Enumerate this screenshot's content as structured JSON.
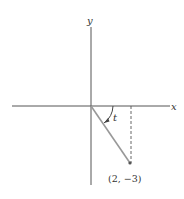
{
  "diagram": {
    "axes": {
      "x_label": "x",
      "y_label": "y"
    },
    "angle_label": "t",
    "point": {
      "x": 2,
      "y": -3,
      "label": "(2, −3)"
    },
    "colors": {
      "axis": "#555555",
      "segment": "#999999",
      "dashed": "#555555",
      "text": "#333333"
    }
  }
}
